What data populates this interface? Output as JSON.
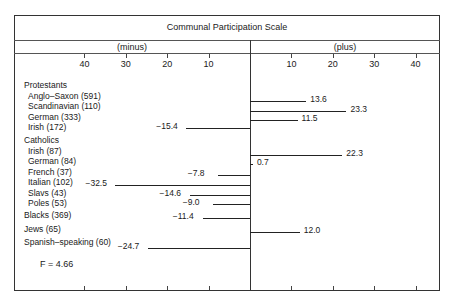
{
  "chart_data": {
    "type": "bar",
    "orientation": "horizontal-diverging",
    "title": "Communal Participation Scale",
    "left_label": "(minus)",
    "right_label": "(plus)",
    "xlim": [
      -40,
      40
    ],
    "ticks": {
      "left": [
        "40",
        "30",
        "20",
        "10"
      ],
      "right": [
        "10",
        "20",
        "30",
        "40"
      ]
    },
    "groups": [
      {
        "name": "Protestants",
        "items": [
          {
            "label": "Anglo–Saxon (591)",
            "value": 13.6,
            "text": "13.6"
          },
          {
            "label": "Scandinavian (110)",
            "value": 23.3,
            "text": "23.3"
          },
          {
            "label": "German (333)",
            "value": 11.5,
            "text": "11.5"
          },
          {
            "label": "Irish (172)",
            "value": -15.4,
            "text": "−15.4"
          }
        ]
      },
      {
        "name": "Catholics",
        "items": [
          {
            "label": "Irish (87)",
            "value": 22.3,
            "text": "22.3"
          },
          {
            "label": "German (84)",
            "value": 0.7,
            "text": "0.7"
          },
          {
            "label": "French (37)",
            "value": -7.8,
            "text": "−7.8"
          },
          {
            "label": "Italian (102)",
            "value": -32.5,
            "text": "−32.5"
          },
          {
            "label": "Slavs (43)",
            "value": -14.6,
            "text": "−14.6"
          },
          {
            "label": "Poles (53)",
            "value": -9.0,
            "text": "−9.0"
          }
        ]
      },
      {
        "name": null,
        "items": [
          {
            "label": "Blacks (369)",
            "value": -11.4,
            "text": "−11.4"
          },
          {
            "label": "Jews (65)",
            "value": 12.0,
            "text": "12.0"
          },
          {
            "label": "Spanish–speaking (60)",
            "value": -24.7,
            "text": "−24.7"
          }
        ]
      }
    ],
    "annotation": "F = 4.66"
  }
}
